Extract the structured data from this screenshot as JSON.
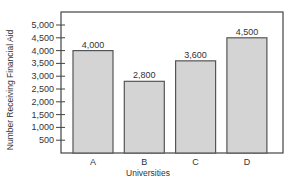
{
  "chart_data": {
    "type": "bar",
    "title": "",
    "xlabel": "Universities",
    "ylabel": "Number Receiving Financial Aid",
    "categories": [
      "A",
      "B",
      "C",
      "D"
    ],
    "values": [
      4000,
      2800,
      3600,
      4500
    ],
    "data_labels": [
      "4,000",
      "2,800",
      "3,600",
      "4,500"
    ],
    "ylim": [
      0,
      5500
    ],
    "yticks": [
      500,
      1000,
      1500,
      2000,
      2500,
      3000,
      3500,
      4000,
      4500,
      5000
    ],
    "ytick_labels": [
      "500",
      "1,000",
      "1,500",
      "2,000",
      "2,500",
      "3,000",
      "3,500",
      "4,000",
      "4,500",
      "5,000"
    ],
    "grid": false,
    "legend": null,
    "colors": {
      "bar_fill": "#d4d4d4",
      "bar_stroke": "#555555",
      "axis": "#444444"
    }
  }
}
